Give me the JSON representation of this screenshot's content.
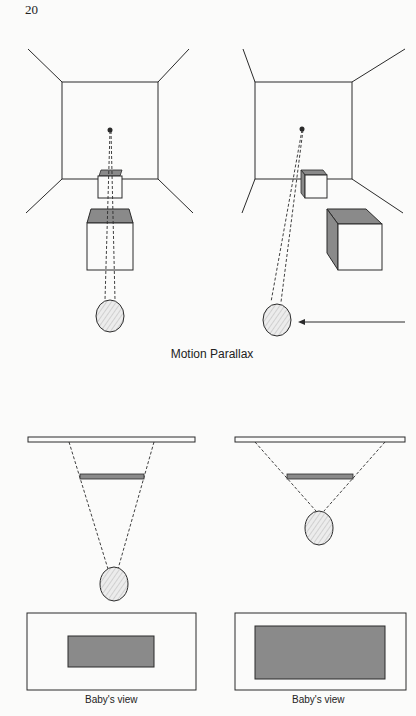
{
  "page": {
    "number": "20"
  },
  "figure_top": {
    "caption": "Motion Parallax",
    "panels": [
      {
        "id": "left",
        "description": "Viewer head directly in front; near and far boxes align along line of sight to a dot on back wall"
      },
      {
        "id": "right",
        "description": "Viewer head moved left (arrow); near box appears displaced to the right relative to far box"
      }
    ],
    "arrow": "movement-direction-left"
  },
  "figure_bottom": {
    "panels": [
      {
        "id": "left",
        "label": "Baby's view",
        "description": "Head far from gray bar; bar occludes small portion of wall"
      },
      {
        "id": "right",
        "label": "Baby's view",
        "description": "Head close to gray bar; bar occludes large portion of wall"
      }
    ]
  },
  "colors": {
    "line": "#2a2a2a",
    "shade": "#8a8a8a",
    "background": "#fbfbfa",
    "head_fill": "#e6e6e6"
  }
}
